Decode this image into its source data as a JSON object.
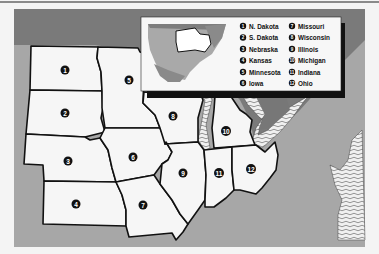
{
  "map": {
    "title": "Midwest states",
    "colors": {
      "land": "#f6f6f6",
      "frame": "#a7a7a7",
      "water_dark": "#777777",
      "border": "#111111",
      "badge": "#111111"
    },
    "states": [
      {
        "num": "1",
        "name": "N. Dakota"
      },
      {
        "num": "2",
        "name": "S. Dakota"
      },
      {
        "num": "3",
        "name": "Nebraska"
      },
      {
        "num": "4",
        "name": "Kansas"
      },
      {
        "num": "5",
        "name": "Minnesota"
      },
      {
        "num": "6",
        "name": "Iowa"
      },
      {
        "num": "7",
        "name": "Missouri"
      },
      {
        "num": "8",
        "name": "Wisconsin"
      },
      {
        "num": "9",
        "name": "Illinois"
      },
      {
        "num": "10",
        "name": "Michigan"
      },
      {
        "num": "11",
        "name": "Indiana"
      },
      {
        "num": "12",
        "name": "Ohio"
      }
    ]
  },
  "legend": {
    "locator": "US locator map with Midwest region outlined",
    "items": [
      {
        "num": "1",
        "label": "N. Dakota"
      },
      {
        "num": "2",
        "label": "S. Dakota"
      },
      {
        "num": "3",
        "label": "Nebraska"
      },
      {
        "num": "4",
        "label": "Kansas"
      },
      {
        "num": "5",
        "label": "Minnesota"
      },
      {
        "num": "6",
        "label": "Iowa"
      },
      {
        "num": "7",
        "label": "Missouri"
      },
      {
        "num": "8",
        "label": "Wisconsin"
      },
      {
        "num": "9",
        "label": "Illinois"
      },
      {
        "num": "10",
        "label": "Michigan"
      },
      {
        "num": "11",
        "label": "Indiana"
      },
      {
        "num": "12",
        "label": "Ohio"
      }
    ]
  }
}
